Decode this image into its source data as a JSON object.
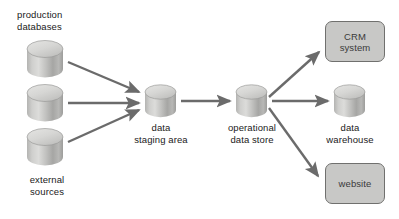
{
  "diagram": {
    "colors": {
      "arrow": "#6b6b6b",
      "cylinder_top": "#d5d5d3",
      "cylinder_body_light": "#c9c9c7",
      "cylinder_body_dark": "#9a9a98",
      "box_fill": "#c8c8c6",
      "box_border": "#70706e",
      "text": "#1a1a1a",
      "background": "#ffffff"
    },
    "nodes": [
      {
        "id": "production-databases",
        "shape": "cylinder",
        "label": "production\ndatabases",
        "label_position": "above",
        "count": 3
      },
      {
        "id": "external-sources",
        "shape": "cylinder",
        "label": "external\nsources",
        "label_position": "below"
      },
      {
        "id": "data-staging-area",
        "shape": "cylinder",
        "label": "data\nstaging area",
        "label_position": "below"
      },
      {
        "id": "operational-data-store",
        "shape": "cylinder",
        "label": "operational\ndata store",
        "label_position": "below"
      },
      {
        "id": "data-warehouse",
        "shape": "cylinder",
        "label": "data\nwarehouse",
        "label_position": "below"
      },
      {
        "id": "crm-system",
        "shape": "rounded-rect",
        "label": "CRM\nsystem"
      },
      {
        "id": "website",
        "shape": "rounded-rect",
        "label": "website"
      }
    ],
    "edges": [
      {
        "id": "edge-db1-to-staging",
        "from": "production-database-1",
        "to": "data-staging-area"
      },
      {
        "id": "edge-db2-to-staging",
        "from": "production-database-2",
        "to": "data-staging-area"
      },
      {
        "id": "edge-external-to-staging",
        "from": "external-sources",
        "to": "data-staging-area"
      },
      {
        "id": "edge-staging-to-ods",
        "from": "data-staging-area",
        "to": "operational-data-store"
      },
      {
        "id": "edge-ods-to-crm",
        "from": "operational-data-store",
        "to": "crm-system"
      },
      {
        "id": "edge-ods-to-warehouse",
        "from": "operational-data-store",
        "to": "data-warehouse"
      },
      {
        "id": "edge-ods-to-website",
        "from": "operational-data-store",
        "to": "website"
      }
    ]
  }
}
